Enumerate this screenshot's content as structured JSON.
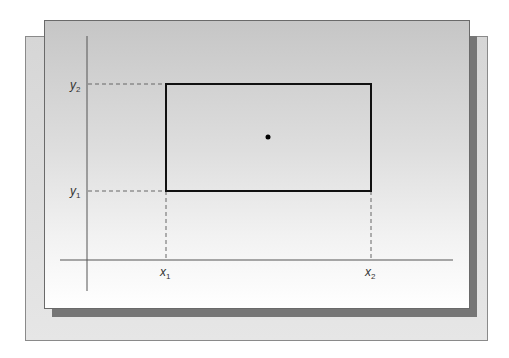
{
  "diagram": {
    "type": "rectangle-center",
    "labels": {
      "x1": {
        "base": "x",
        "sub": "1"
      },
      "x2": {
        "base": "x",
        "sub": "2"
      },
      "y1": {
        "base": "y",
        "sub": "1"
      },
      "y2": {
        "base": "y",
        "sub": "2"
      }
    },
    "colors": {
      "shadow": "#767676",
      "rectangle_stroke": "#111111",
      "axis": "#555555",
      "dashed": "#666666"
    }
  }
}
